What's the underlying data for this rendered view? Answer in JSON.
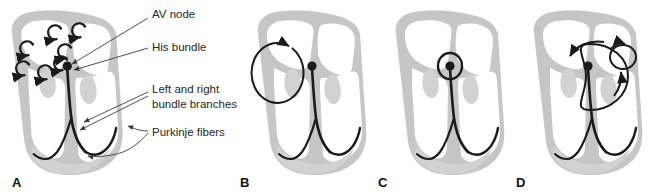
{
  "figure": {
    "panel_count": 4,
    "colors": {
      "heart_wall": "#c6c6c6",
      "heart_wall_light": "#d8d8d8",
      "chamber_fill": "#ffffff",
      "conduction_path": "#1a1a1a",
      "arrow": "#1a1a1a",
      "label_text": "#262626",
      "leader_line": "#3b3b3b",
      "background": "#ffffff"
    }
  },
  "labels": [
    {
      "id": "av-node",
      "text": "AV node"
    },
    {
      "id": "his-bundle",
      "text": "His bundle"
    },
    {
      "id": "bundle-branches",
      "line1": "Left and right",
      "line2": "bundle branches"
    },
    {
      "id": "purkinje",
      "text": "Purkinje fibers"
    }
  ],
  "panels": [
    {
      "id": "A",
      "letter": "A",
      "name": "panel-a-normal-conduction",
      "description": "Heart with labeled conduction system and multiple small circular atrial arrows",
      "atrial_arrow_count": 7
    },
    {
      "id": "B",
      "letter": "B",
      "name": "panel-b-atrial-reentry",
      "description": "Heart with single large circular reentry loop in the atrium",
      "loop_count": 1
    },
    {
      "id": "C",
      "letter": "C",
      "name": "panel-c-av-nodal-reentry",
      "description": "Heart with small circular reentry loop around the AV node",
      "loop_count": 1
    },
    {
      "id": "D",
      "letter": "D",
      "name": "panel-d-dual-reentry",
      "description": "Heart with a large reentry loop and a small secondary circular loop",
      "loop_count": 2
    }
  ]
}
